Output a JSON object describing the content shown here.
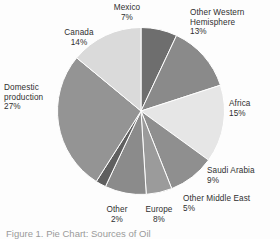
{
  "figure": {
    "caption": "Figure 1. Pie Chart: Sources of Oil"
  },
  "chart_data": {
    "type": "pie",
    "title": "",
    "xlabel": "",
    "ylabel": "",
    "legend_position": "labels-outside",
    "grid": false,
    "start_angle_deg": 0,
    "direction": "clockwise",
    "units": "percent",
    "total": 100,
    "categories": [
      "Mexico",
      "Other Western Hemisphere",
      "Africa",
      "Saudi Arabia",
      "Other Middle East",
      "Europe",
      "Other",
      "Domestic production",
      "Canada"
    ],
    "values": [
      7,
      13,
      15,
      9,
      5,
      8,
      2,
      27,
      14
    ],
    "slices": [
      {
        "label": "Mexico",
        "value": 7,
        "value_text": "7%",
        "color": "#6e6e6e"
      },
      {
        "label": "Other Western Hemisphere",
        "value": 13,
        "value_text": "13%",
        "color": "#8a8a8a"
      },
      {
        "label": "Africa",
        "value": 15,
        "value_text": "15%",
        "color": "#e6e6e6"
      },
      {
        "label": "Saudi Arabia",
        "value": 9,
        "value_text": "9%",
        "color": "#8f8f8f"
      },
      {
        "label": "Other Middle East",
        "value": 5,
        "value_text": "5%",
        "color": "#9b9b9b"
      },
      {
        "label": "Europe",
        "value": 8,
        "value_text": "8%",
        "color": "#8b8b8b"
      },
      {
        "label": "Other",
        "value": 2,
        "value_text": "2%",
        "color": "#5f5f5f"
      },
      {
        "label": "Domestic production",
        "value": 27,
        "value_text": "27%",
        "color": "#949494"
      },
      {
        "label": "Canada",
        "value": 14,
        "value_text": "14%",
        "color": "#dadada"
      }
    ]
  },
  "labels": {
    "mexico": {
      "name": "Mexico",
      "pct": "7%"
    },
    "owh": {
      "name": "Other Western",
      "name2": "Hemisphere",
      "pct": "13%"
    },
    "canada": {
      "name": "Canada",
      "pct": "14%"
    },
    "africa": {
      "name": "Africa",
      "pct": "15%"
    },
    "domestic": {
      "name": "Domestic",
      "name2": "production",
      "pct": "27%"
    },
    "saudi": {
      "name": "Saudi Arabia",
      "pct": "9%"
    },
    "ome": {
      "name": "Other Middle East",
      "pct": "5%"
    },
    "europe": {
      "name": "Europe",
      "pct": "8%"
    },
    "other": {
      "name": "Other",
      "pct": "2%"
    }
  }
}
